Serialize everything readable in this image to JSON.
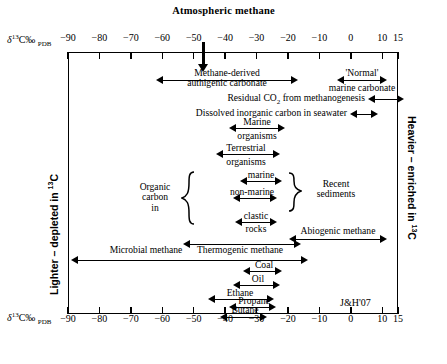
{
  "title": "Atmospheric methane",
  "attribution": "J&H'07",
  "axis": {
    "label_delta": "δ",
    "label_sup": "13",
    "label_mid": "C‰ ",
    "label_sub": "PDB",
    "unit_note": "δ13C‰ PDB",
    "min": -90,
    "max": 15,
    "ticks": [
      -90,
      -80,
      -70,
      -60,
      -50,
      -40,
      -30,
      -20,
      -10,
      0,
      10,
      15
    ],
    "tick_labels": [
      "-90",
      "-80",
      "-70",
      "-60",
      "-50",
      "-40",
      "-30",
      "-20",
      "-10",
      "0",
      "10",
      "15"
    ],
    "left_side_label": "Lighter – depleted in ",
    "left_side_sup": "13",
    "left_side_tail": "C",
    "right_side_label": "Heavier – enriched in ",
    "right_side_sup": "13",
    "right_side_tail": "C"
  },
  "pointer": {
    "name": "atmospheric-methane-pointer",
    "value": -47
  },
  "chart_data": {
    "type": "range-bar",
    "title": "Atmospheric methane",
    "xlabel": "δ13C‰ PDB",
    "xlim": [
      -90,
      15
    ],
    "grid": false,
    "legend": "none",
    "annotations": [
      "Atmospheric methane pointer at -47 ‰",
      "J&H'07"
    ],
    "ranges": [
      {
        "label": "Methane-derived authigenic carbonate",
        "min": -60,
        "max": -20
      },
      {
        "label": "'Normal' marine carbonate",
        "min": -5,
        "max": 5
      },
      {
        "label": "Residual CO2 from methanogenesis",
        "min": 5,
        "max": 15
      },
      {
        "label": "Dissolved inorganic carbon in seawater",
        "min": -3,
        "max": 2
      },
      {
        "label": "Marine organisms",
        "min": -30,
        "max": -17
      },
      {
        "label": "Terrestrial organisms",
        "min": -34,
        "max": -19
      },
      {
        "label": "marine",
        "min": -27,
        "max": -17
      },
      {
        "label": "non-marine",
        "min": -29,
        "max": -20
      },
      {
        "label": "clastic rocks",
        "min": -28,
        "max": -18
      },
      {
        "label": "Recent sediments",
        "min": -29,
        "max": -17
      },
      {
        "label": "Abiogenic methane",
        "min": -20,
        "max": -2
      },
      {
        "label": "Microbial methane",
        "min": -90,
        "max": -45
      },
      {
        "label": "Thermogenic methane",
        "min": -55,
        "max": -20
      },
      {
        "label": "Coal",
        "min": -28,
        "max": -21
      },
      {
        "label": "Oil",
        "min": -31,
        "max": -22
      },
      {
        "label": "Ethane",
        "min": -40,
        "max": -22
      },
      {
        "label": "Propane",
        "min": -35,
        "max": -23
      },
      {
        "label": "Butane",
        "min": -35,
        "max": -24
      }
    ]
  },
  "rows": [
    {
      "name": "methane-derived-authigenic-carbonate",
      "line1": "Methane-derived",
      "line2": "authigenic carbonate"
    },
    {
      "name": "normal-marine-carbonate",
      "line1": "'Normal'",
      "line2": "marine carbonate"
    },
    {
      "name": "residual-co2-methanogenesis",
      "text_a": "Residual CO",
      "text_sub": "2",
      "text_b": " from methanogenesis"
    },
    {
      "name": "dissolved-inorganic-carbon",
      "text": "Dissolved inorganic carbon in seawater"
    },
    {
      "name": "marine-organisms",
      "line1": "Marine",
      "line2": "organisms"
    },
    {
      "name": "terrestrial-organisms",
      "line1": "Terrestrial",
      "line2": "organisms"
    },
    {
      "name": "organic-carbon-in",
      "line1": "Organic",
      "line2": "carbon",
      "line3": "in"
    },
    {
      "name": "organic-carbon-marine",
      "text": "marine"
    },
    {
      "name": "organic-carbon-non-marine",
      "text": "non-marine"
    },
    {
      "name": "organic-carbon-clastic-rocks",
      "line1": "clastic",
      "line2": "rocks"
    },
    {
      "name": "recent-sediments",
      "line1": "Recent",
      "line2": "sediments"
    },
    {
      "name": "abiogenic-methane",
      "text": "Abiogenic methane"
    },
    {
      "name": "microbial-methane",
      "text": "Microbial methane"
    },
    {
      "name": "thermogenic-methane",
      "text": "Thermogenic methane"
    },
    {
      "name": "coal",
      "text": "Coal"
    },
    {
      "name": "oil",
      "text": "Oil"
    },
    {
      "name": "ethane",
      "text": "Ethane"
    },
    {
      "name": "propane",
      "text": "Propane"
    },
    {
      "name": "butane",
      "text": "Butane"
    }
  ]
}
